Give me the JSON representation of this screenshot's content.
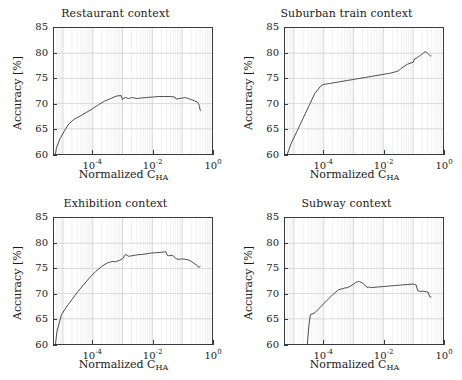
{
  "figure": {
    "xlabel_main": "Normalized C",
    "xlabel_sub": "HA",
    "ylabel": "Accuracy [%]",
    "xticks": [
      {
        "mantissa": "10",
        "exp": "-4",
        "value": -4
      },
      {
        "mantissa": "10",
        "exp": "-2",
        "value": -2
      },
      {
        "mantissa": "10",
        "exp": "0",
        "value": 0
      }
    ],
    "yticks": [
      "85",
      "80",
      "75",
      "70",
      "65",
      "60"
    ],
    "line_color": "#3a3a3a",
    "grid_color": "#cfcfcf",
    "minor_grid_color": "#e8e8e8",
    "axis_color": "#3a3a3a"
  },
  "chart_data": [
    {
      "type": "line",
      "title": "Restaurant context",
      "xlabel": "Normalized C_HA",
      "ylabel": "Accuracy [%]",
      "xscale": "log",
      "xlim": [
        -5.3,
        0.0
      ],
      "ylim": [
        60,
        85
      ],
      "grid": true,
      "legend": "none",
      "x_log10": [
        -5.25,
        -5.22,
        -5.1,
        -4.95,
        -4.8,
        -4.6,
        -4.4,
        -4.2,
        -4.0,
        -3.8,
        -3.6,
        -3.4,
        -3.2,
        -3.05,
        -3.0,
        -2.95,
        -2.9,
        -2.8,
        -2.7,
        -2.6,
        -2.5,
        -2.4,
        -2.2,
        -2.0,
        -1.8,
        -1.6,
        -1.4,
        -1.25,
        -1.2,
        -1.1,
        -1.0,
        -0.9,
        -0.8,
        -0.7,
        -0.6,
        -0.5,
        -0.45,
        -0.42,
        -0.4,
        -0.38
      ],
      "y": [
        60.0,
        61.2,
        63.0,
        64.6,
        66.0,
        67.0,
        67.6,
        68.3,
        69.0,
        69.8,
        70.5,
        71.0,
        71.5,
        71.6,
        70.8,
        71.1,
        71.2,
        71.0,
        71.2,
        71.1,
        71.0,
        71.1,
        71.2,
        71.3,
        71.4,
        71.4,
        71.4,
        71.3,
        70.9,
        71.0,
        71.1,
        71.2,
        71.0,
        70.8,
        70.6,
        70.3,
        70.0,
        69.4,
        68.7,
        68.6
      ]
    },
    {
      "type": "line",
      "title": "Suburban train context",
      "xlabel": "Normalized C_HA",
      "ylabel": "Accuracy [%]",
      "xscale": "log",
      "xlim": [
        -5.3,
        0.0
      ],
      "ylim": [
        60,
        85
      ],
      "grid": true,
      "legend": "none",
      "x_log10": [
        -5.22,
        -5.1,
        -4.9,
        -4.7,
        -4.5,
        -4.3,
        -4.1,
        -4.05,
        -4.0,
        -3.8,
        -3.5,
        -3.2,
        -3.0,
        -2.8,
        -2.6,
        -2.4,
        -2.2,
        -2.0,
        -1.8,
        -1.6,
        -1.5,
        -1.45,
        -1.4,
        -1.3,
        -1.2,
        -1.1,
        -1.0,
        -0.95,
        -0.9,
        -0.85,
        -0.8,
        -0.75,
        -0.7,
        -0.65,
        -0.6,
        -0.55,
        -0.5,
        -0.45,
        -0.42,
        -0.4
      ],
      "y": [
        60.0,
        62.0,
        64.5,
        67.0,
        69.5,
        72.0,
        73.5,
        73.7,
        73.8,
        74.0,
        74.3,
        74.6,
        74.8,
        75.0,
        75.2,
        75.4,
        75.6,
        75.8,
        76.0,
        76.3,
        76.5,
        76.7,
        77.0,
        77.4,
        77.8,
        78.0,
        78.2,
        78.9,
        79.0,
        79.2,
        79.4,
        79.6,
        79.8,
        80.1,
        80.3,
        80.2,
        79.9,
        79.6,
        79.4,
        79.5
      ]
    },
    {
      "type": "line",
      "title": "Exhibition context",
      "xlabel": "Normalized C_HA",
      "ylabel": "Accuracy [%]",
      "xscale": "log",
      "xlim": [
        -5.3,
        0.0
      ],
      "ylim": [
        60,
        85
      ],
      "grid": true,
      "legend": "none",
      "x_log10": [
        -5.25,
        -5.2,
        -5.05,
        -4.9,
        -4.7,
        -4.5,
        -4.3,
        -4.1,
        -3.9,
        -3.7,
        -3.5,
        -3.4,
        -3.3,
        -3.25,
        -3.2,
        -3.1,
        -3.0,
        -2.9,
        -2.8,
        -2.7,
        -2.6,
        -2.5,
        -2.3,
        -2.1,
        -1.9,
        -1.7,
        -1.55,
        -1.5,
        -1.45,
        -1.4,
        -1.3,
        -1.2,
        -1.1,
        -1.0,
        -0.9,
        -0.8,
        -0.7,
        -0.6,
        -0.5,
        -0.45,
        -0.4
      ],
      "y": [
        60.0,
        62.5,
        65.8,
        67.2,
        68.8,
        70.4,
        71.8,
        73.2,
        74.4,
        75.4,
        76.1,
        76.3,
        76.4,
        76.3,
        76.4,
        76.6,
        76.9,
        77.8,
        77.4,
        77.5,
        77.6,
        77.7,
        77.8,
        78.0,
        78.1,
        78.2,
        78.3,
        77.6,
        77.5,
        77.6,
        77.5,
        76.9,
        76.8,
        76.9,
        76.8,
        76.7,
        76.4,
        76.0,
        75.6,
        75.2,
        75.4
      ]
    },
    {
      "type": "line",
      "title": "Subway context",
      "xlabel": "Normalized C_HA",
      "ylabel": "Accuracy [%]",
      "xscale": "log",
      "xlim": [
        -5.3,
        0.0
      ],
      "ylim": [
        60,
        85
      ],
      "grid": true,
      "legend": "none",
      "x_log10": [
        -4.55,
        -4.5,
        -4.45,
        -4.3,
        -4.1,
        -3.9,
        -3.7,
        -3.5,
        -3.35,
        -3.3,
        -3.2,
        -3.1,
        -3.0,
        -2.9,
        -2.8,
        -2.7,
        -2.6,
        -2.55,
        -2.5,
        -2.4,
        -2.2,
        -2.0,
        -1.8,
        -1.6,
        -1.4,
        -1.2,
        -1.0,
        -0.9,
        -0.85,
        -0.8,
        -0.75,
        -0.7,
        -0.6,
        -0.5,
        -0.45,
        -0.4
      ],
      "y": [
        60.0,
        63.5,
        65.8,
        66.2,
        67.4,
        68.6,
        69.8,
        70.8,
        71.0,
        71.1,
        71.2,
        71.5,
        71.9,
        72.3,
        72.4,
        72.1,
        71.6,
        71.2,
        71.3,
        71.2,
        71.3,
        71.4,
        71.5,
        71.6,
        71.7,
        71.8,
        71.9,
        71.7,
        70.6,
        70.5,
        70.4,
        70.5,
        70.4,
        70.3,
        69.4,
        69.3
      ]
    }
  ]
}
